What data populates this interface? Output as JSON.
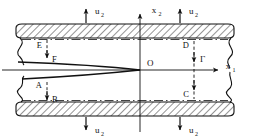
{
  "figure": {
    "background_color": "#ffffff",
    "line_color": "#111111",
    "hatch_color": "#111111"
  },
  "axes": {
    "horizontal": {
      "label": "x",
      "subscript": "1",
      "name": "x1-axis"
    },
    "vertical": {
      "label": "x",
      "subscript": "2",
      "name": "x2-axis"
    },
    "origin": {
      "label": "O"
    }
  },
  "loads": {
    "symbol": "u",
    "subscript": "2",
    "top": [
      {
        "label": "u",
        "subscript": "2",
        "direction": "up"
      },
      {
        "label": "u",
        "subscript": "2",
        "direction": "up"
      }
    ],
    "bottom": [
      {
        "label": "u",
        "subscript": "2",
        "direction": "down"
      },
      {
        "label": "u",
        "subscript": "2",
        "direction": "down"
      }
    ]
  },
  "points": [
    {
      "id": "E",
      "label": "E",
      "position": "upper-left"
    },
    {
      "id": "F",
      "label": "F",
      "position": "upper-left-inner"
    },
    {
      "id": "A",
      "label": "A",
      "position": "lower-left"
    },
    {
      "id": "B",
      "label": "B",
      "position": "lower-left-inner"
    },
    {
      "id": "D",
      "label": "D",
      "position": "upper-right"
    },
    {
      "id": "C",
      "label": "C",
      "position": "lower-right"
    }
  ],
  "contour": {
    "label": "Γ",
    "name": "contour-gamma",
    "description": "dashed vertical path from D to C"
  },
  "regions": {
    "top_plate": "hatched rigid boundary",
    "bottom_plate": "hatched rigid boundary",
    "crack": "lens-shaped crack closing at origin"
  }
}
